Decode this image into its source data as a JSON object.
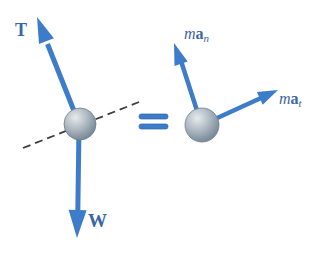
{
  "figure": {
    "equals_symbol": "=",
    "left_diagram": {
      "tension_label": "T",
      "weight_label": "W"
    },
    "right_diagram": {
      "ma_n": {
        "m": "m",
        "a": "a",
        "sub": "n"
      },
      "ma_t": {
        "m": "m",
        "a": "a",
        "sub": "t"
      }
    },
    "colors": {
      "background": "#ffffff",
      "arrow_blue": "#3d7cc9",
      "arrow_dark": "#2d66b0",
      "label_blue": "#3b66a8",
      "dash_gray": "#3e3e3e",
      "ball_highlight": "#e7eaec",
      "ball_mid": "#b4bec6",
      "ball_shadow": "#8695a2",
      "ball_edge": "#6e7f8d"
    }
  }
}
